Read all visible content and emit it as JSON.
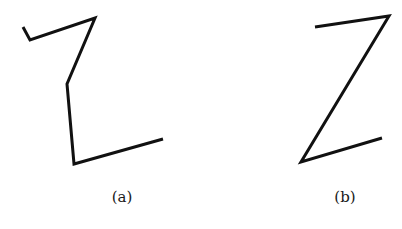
{
  "figures": [
    {
      "id": "a",
      "label": "(a)",
      "points": [
        [
          23,
          27
        ],
        [
          30,
          40
        ],
        [
          95,
          18
        ],
        [
          67,
          84
        ],
        [
          74,
          164
        ],
        [
          163,
          139
        ]
      ],
      "label_pos": [
        122,
        188
      ]
    },
    {
      "id": "b",
      "label": "(b)",
      "points": [
        [
          315,
          27
        ],
        [
          389,
          16
        ],
        [
          301,
          162
        ],
        [
          382,
          138
        ]
      ],
      "label_pos": [
        345,
        188
      ]
    }
  ],
  "stroke_color": "#111111"
}
